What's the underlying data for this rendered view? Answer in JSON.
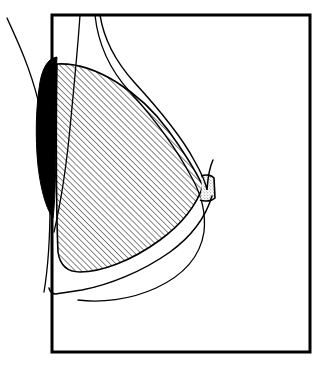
{
  "figure": {
    "background_color": "#ffffff",
    "ink_color": "#000000"
  },
  "frame": {
    "label": "imaging-field-frame",
    "x": 52,
    "y": 15,
    "width": 258,
    "height": 337,
    "stroke_color": "#000000",
    "stroke_width": 3,
    "fill": "none"
  },
  "regions": {
    "glandular_cone": {
      "label": "Hatched glandular tissue cone",
      "fill_pattern": "diagonal-hatch",
      "hatch_angle_deg": 45,
      "hatch_spacing_px": 4,
      "hatch_stroke_width": 0.9,
      "stroke_color": "#000000",
      "stroke_width": 1.6,
      "apex_x": 203,
      "apex_y": 188,
      "base_x": 57
    },
    "chest_wall_wedge": {
      "label": "Solid black chest wall / pectoral wedge",
      "fill_color": "#000000",
      "top_x": 40,
      "top_y": 57,
      "bottom_x": 56,
      "bottom_y": 218
    },
    "nipple": {
      "label": "Stippled nipple",
      "fill_pattern": "stipple-dots",
      "stroke_color": "#000000",
      "stroke_width": 1.6,
      "x": 201,
      "y": 175,
      "width": 15,
      "height": 26
    }
  },
  "contours": [
    {
      "name": "outer-skin-contour",
      "label": "Outer skin contour sweeping from upper body over the breast to the nipple",
      "stroke_width": 1.5
    },
    {
      "name": "lower-skin-contour",
      "label": "Lower skin contour running from nipple to the inframammary fold",
      "stroke_width": 1.5
    },
    {
      "name": "chest-profile-curve",
      "label": "Far-left chest / torso profile curve entering at top-left",
      "stroke_width": 1.3
    },
    {
      "name": "inner-chest-curve",
      "label": "Inner chest wall curve entering through the top frame edge",
      "stroke_width": 1.3
    },
    {
      "name": "rib-line-curve",
      "label": "Short rib line descending from the top frame edge",
      "stroke_width": 1.3
    }
  ],
  "caption": {
    "text": "",
    "visible": false
  }
}
